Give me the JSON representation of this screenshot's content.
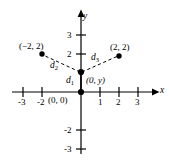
{
  "figure": {
    "type": "cartesian-coordinate-plane",
    "background_color": "#ffffff",
    "ink_color": "#000000",
    "axes": {
      "x_axis_label": "x",
      "y_axis_label": "y",
      "x_ticks": [
        "-3",
        "-2",
        "1",
        "2",
        "3"
      ],
      "y_ticks": [
        "3",
        "2",
        "-2",
        "-3"
      ],
      "x_range": [
        -3.6,
        3.9
      ],
      "y_range": [
        -3.6,
        3.7
      ],
      "grid": false
    },
    "points": [
      {
        "id": "point-left",
        "label": "(−2, 2)",
        "x": -2,
        "y": 2
      },
      {
        "id": "point-right",
        "label": "(2, 2)",
        "x": 2,
        "y": 2
      },
      {
        "id": "point-unknown",
        "label": "(0, y)",
        "x": 0,
        "y": 1
      },
      {
        "id": "point-origin",
        "label": "(0, 0)",
        "x": 0,
        "y": 0
      }
    ],
    "segments": [
      {
        "id": "segment-d1",
        "label": "d",
        "subscript": "1",
        "from": "point-origin",
        "to": "point-unknown",
        "style": "solid"
      },
      {
        "id": "segment-d2",
        "label": "d",
        "subscript": "2",
        "from": "point-unknown",
        "to": "point-left",
        "style": "dashed"
      },
      {
        "id": "segment-d3",
        "label": "d",
        "subscript": "3",
        "from": "point-unknown",
        "to": "point-right",
        "style": "dashed"
      }
    ]
  }
}
